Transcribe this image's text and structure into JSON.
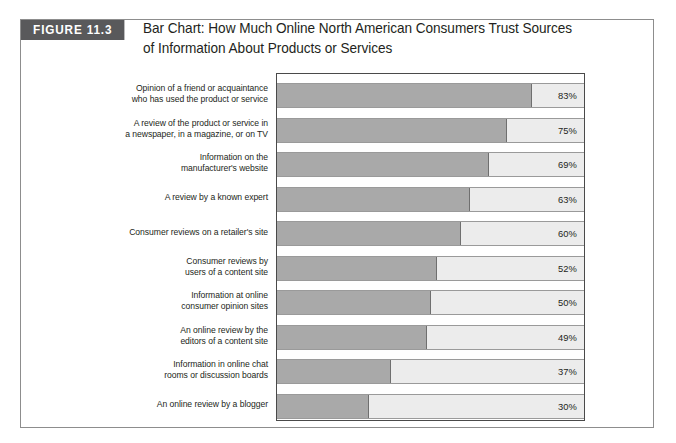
{
  "page_bleed_text": "…",
  "figure": {
    "tag": "FIGURE 11.3",
    "title_line1": "Bar Chart: How Much Online North American Consumers Trust Sources",
    "title_line2": "of Information About Products or Services"
  },
  "colors": {
    "tag_background": "#59595b",
    "tag_text": "#ffffff",
    "bar_fill": "#a9a9a9",
    "bar_track": "#ececec",
    "frame_border": "#4a4a4a",
    "figure_border": "#8d8d8d",
    "text": "#231f20"
  },
  "chart_data": {
    "type": "bar",
    "orientation": "horizontal",
    "title": "Bar Chart: How Much Online North American Consumers Trust Sources of Information About Products or Services",
    "xlabel": "",
    "ylabel": "",
    "xlim": [
      0,
      100
    ],
    "grid": false,
    "legend": null,
    "value_suffix": "%",
    "categories": [
      "Opinion of a friend or acquaintance who has used the product or service",
      "A review of the product or service in a newspaper, in a magazine, or on TV",
      "Information on the manufacturer's website",
      "A review by a known expert",
      "Consumer reviews on a retailer's site",
      "Consumer reviews by users of a content site",
      "Information at online consumer opinion sites",
      "An online review by the editors of a content site",
      "Information in online chat rooms or discussion boards",
      "An online review by a blogger"
    ],
    "values": [
      83,
      75,
      69,
      63,
      60,
      52,
      50,
      49,
      37,
      30
    ],
    "bars": [
      {
        "label_line1": "Opinion of a friend or acquaintance",
        "label_line2": "who has used the product or service",
        "value": 83,
        "value_label": "83%"
      },
      {
        "label_line1": "A review of the product or service in",
        "label_line2": "a newspaper, in a magazine, or on TV",
        "value": 75,
        "value_label": "75%"
      },
      {
        "label_line1": "Information on the",
        "label_line2": "manufacturer's website",
        "value": 69,
        "value_label": "69%"
      },
      {
        "label_line1": "A review by a known expert",
        "label_line2": "",
        "value": 63,
        "value_label": "63%"
      },
      {
        "label_line1": "Consumer reviews on a retailer's site",
        "label_line2": "",
        "value": 60,
        "value_label": "60%"
      },
      {
        "label_line1": "Consumer reviews by",
        "label_line2": "users of a content site",
        "value": 52,
        "value_label": "52%"
      },
      {
        "label_line1": "Information at online",
        "label_line2": "consumer opinion sites",
        "value": 50,
        "value_label": "50%"
      },
      {
        "label_line1": "An online review by the",
        "label_line2": "editors of a content site",
        "value": 49,
        "value_label": "49%"
      },
      {
        "label_line1": "Information in online chat",
        "label_line2": "rooms or discussion boards",
        "value": 37,
        "value_label": "37%"
      },
      {
        "label_line1": "An online review by a blogger",
        "label_line2": "",
        "value": 30,
        "value_label": "30%"
      }
    ]
  }
}
